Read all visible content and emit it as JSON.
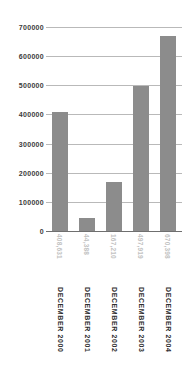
{
  "chart_data": {
    "type": "bar",
    "title": "",
    "subtitle": "",
    "xlabel": "",
    "ylabel": "",
    "categories": [
      "DECEMBER 2000",
      "DECEMBER 2001",
      "DECEMBER 2002",
      "DECEMBER 2003",
      "DECEMBER 2004"
    ],
    "values": [
      408631,
      44388,
      167210,
      497919,
      670398
    ],
    "value_labels": [
      "408,631",
      "44,388",
      "167,210",
      "497,919",
      "670,398"
    ],
    "ylim": [
      0,
      700000
    ],
    "ytick_labels": [
      "700000",
      "600000",
      "500000",
      "400000",
      "300000",
      "200000",
      "100000",
      "0"
    ],
    "ytick_values": [
      700000,
      600000,
      500000,
      400000,
      300000,
      200000,
      100000,
      0
    ],
    "grid": true,
    "legend": false,
    "legend_position": "none",
    "bar_color": "#8c8c8c",
    "gridline_color": "#b9b9b9",
    "axis_color": "#6f6f6f",
    "value_label_color": "#c2c2c2",
    "category_label_color": "#2e2e2e",
    "background_color": "#ffffff"
  }
}
